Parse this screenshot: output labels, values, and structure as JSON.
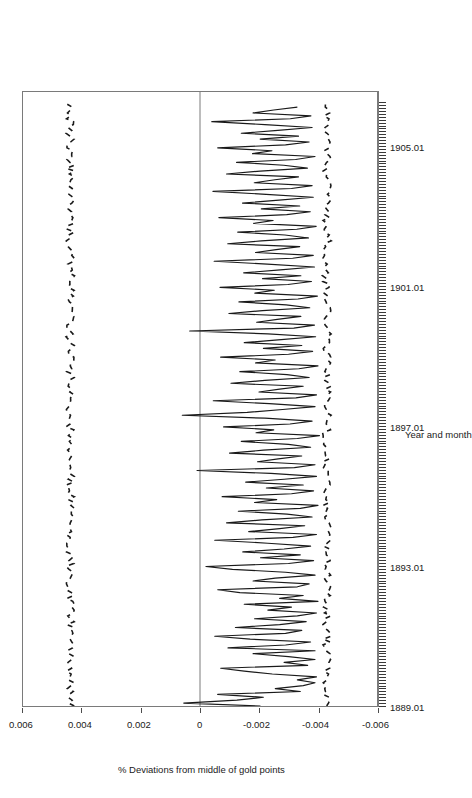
{
  "chart_data": {
    "type": "line",
    "title": "",
    "orientation": "rotated-90-landscape",
    "xlabel": "Year and month",
    "ylabel": "% Deviations from middle of gold points",
    "xtick_labels": [
      "1889.01",
      "1893.01",
      "1897.01",
      "1901.01",
      "1905.01"
    ],
    "xtick_values": [
      1889.01,
      1893.01,
      1897.01,
      1901.01,
      1905.01
    ],
    "xlim": [
      1889.0,
      1906.6
    ],
    "ytick_labels": [
      "0.006",
      "0.004",
      "0.002",
      "0",
      "-0.002",
      "-0.004",
      "-0.006"
    ],
    "ytick_values": [
      0.006,
      0.004,
      0.002,
      0,
      -0.002,
      -0.004,
      -0.006
    ],
    "ylim": [
      -0.006,
      0.006
    ],
    "grid": false,
    "legend": false,
    "zero_line": 0,
    "minor_ticks_axis": "x",
    "minor_tick_interval_months": 1,
    "colors": {
      "line": "#1a1a1a",
      "reference": "#1a1a1a",
      "frame": "#7a7a7a",
      "zero": "#7a7a7a"
    },
    "series": [
      {
        "name": "Deviation from middle of gold points",
        "style": "solid",
        "values": [
          -0.00205,
          0.00055,
          -0.00125,
          -0.00215,
          -0.0006,
          -0.0034,
          -0.00255,
          -0.0035,
          -0.0039,
          -0.0033,
          -0.00395,
          -0.00245,
          -0.0015,
          -0.0007,
          -0.00365,
          -0.00285,
          -0.0039,
          -0.003,
          -0.0018,
          -0.0039,
          -0.00095,
          -0.0029,
          -0.00375,
          -0.0017,
          -0.0005,
          -0.0029,
          -0.00345,
          -0.0012,
          -0.0027,
          -0.0036,
          -0.00185,
          -0.0033,
          -0.00395,
          -0.0023,
          -0.0031,
          -0.0015,
          -0.004,
          -0.0027,
          -0.0035,
          -0.00135,
          -0.0006,
          -0.0033,
          -0.0037,
          -0.0018,
          -0.00255,
          -0.0039,
          -0.0029,
          -0.0011,
          -0.0002,
          -0.003,
          -0.00385,
          -0.00205,
          -0.0034,
          -0.00145,
          -0.00285,
          -0.00375,
          -0.0023,
          -0.0005,
          -0.00315,
          -0.00395,
          -0.00165,
          -0.0027,
          -0.00355,
          -0.0009,
          -0.0021,
          -0.0038,
          -0.00295,
          -0.0013,
          -0.0034,
          -0.004,
          -0.00185,
          -0.0026,
          -0.00075,
          -0.0031,
          -0.00385,
          -0.00225,
          -0.0035,
          -0.00155,
          -0.00285,
          -0.00395,
          -0.0024,
          0.0001,
          -0.0032,
          -0.0039,
          -0.00195,
          -0.00265,
          -0.00345,
          -0.001,
          -0.00215,
          -0.00375,
          -0.003,
          -0.0014,
          -0.0033,
          -0.00405,
          -0.0019,
          -0.0025,
          -0.0008,
          -0.00305,
          -0.0038,
          -0.0022,
          0.0006,
          -0.0016,
          -0.0028,
          -0.0039,
          -0.00235,
          -0.00045,
          -0.00325,
          -0.00395,
          -0.002,
          -0.0027,
          -0.0035,
          -0.00105,
          -0.0022,
          -0.0037,
          -0.00295,
          -0.00135,
          -0.00335,
          -0.004,
          -0.00188,
          -0.00255,
          -0.0007,
          -0.003,
          -0.00382,
          -0.00215,
          -0.00345,
          -0.0015,
          -0.00275,
          -0.00392,
          -0.0023,
          0.00035,
          -0.00318,
          -0.00388,
          -0.00192,
          -0.00262,
          -0.00342,
          -0.00098,
          -0.00212,
          -0.00372,
          -0.00292,
          -0.00132,
          -0.00332,
          -0.00398,
          -0.00186,
          -0.00252,
          -0.00068,
          -0.00298,
          -0.00378,
          -0.00212,
          -0.00342,
          -0.00148,
          -0.00272,
          -0.00388,
          -0.00228,
          -0.00048,
          -0.00314,
          -0.00384,
          -0.00188,
          -0.00258,
          -0.00338,
          -0.00094,
          -0.00208,
          -0.00368,
          -0.00288,
          -0.00128,
          -0.00328,
          -0.00394,
          -0.00182,
          -0.00248,
          -0.00064,
          -0.00294,
          -0.00374,
          -0.00208,
          -0.00338,
          -0.00144,
          -0.00268,
          -0.00384,
          -0.00224,
          -0.00044,
          -0.0031,
          -0.0038,
          -0.00184,
          -0.00254,
          -0.00334,
          -0.0009,
          -0.00204,
          -0.00364,
          -0.00284,
          -0.00124,
          -0.00324,
          -0.0039,
          -0.00178,
          -0.00244,
          -0.0006,
          -0.0029,
          -0.0037,
          -0.00204,
          -0.00334,
          -0.0014,
          -0.00264,
          -0.0038,
          -0.0022,
          -0.0004,
          -0.00306,
          -0.00376,
          -0.0018,
          -0.0025,
          -0.0033
        ]
      },
      {
        "name": "Upper gold point",
        "style": "dashed",
        "approx_level": 0.0044,
        "description": "Dashed reference line wandering near +0.0044"
      },
      {
        "name": "Lower gold point",
        "style": "dashed",
        "approx_level": -0.0043,
        "description": "Dashed reference line wandering near -0.0043"
      }
    ]
  },
  "figure": {
    "xaxis_title": "Year and month",
    "yaxis_title": "% Deviations from middle of gold points"
  }
}
